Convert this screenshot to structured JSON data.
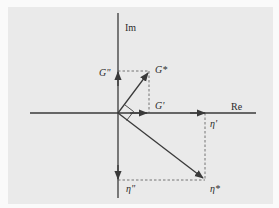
{
  "diagram": {
    "type": "complex-plane phasor diagram",
    "axes": {
      "real_label": "Re",
      "imag_label": "Im"
    },
    "labels": {
      "g_star": "G*",
      "g_prime": "G'",
      "g_double_prime": "G\"",
      "eta_star": "η*",
      "eta_prime": "η'",
      "eta_double_prime": "η\""
    },
    "colors": {
      "panel": "#eaeaea",
      "line": "#3a3a3a",
      "dashed": "#555555"
    }
  }
}
